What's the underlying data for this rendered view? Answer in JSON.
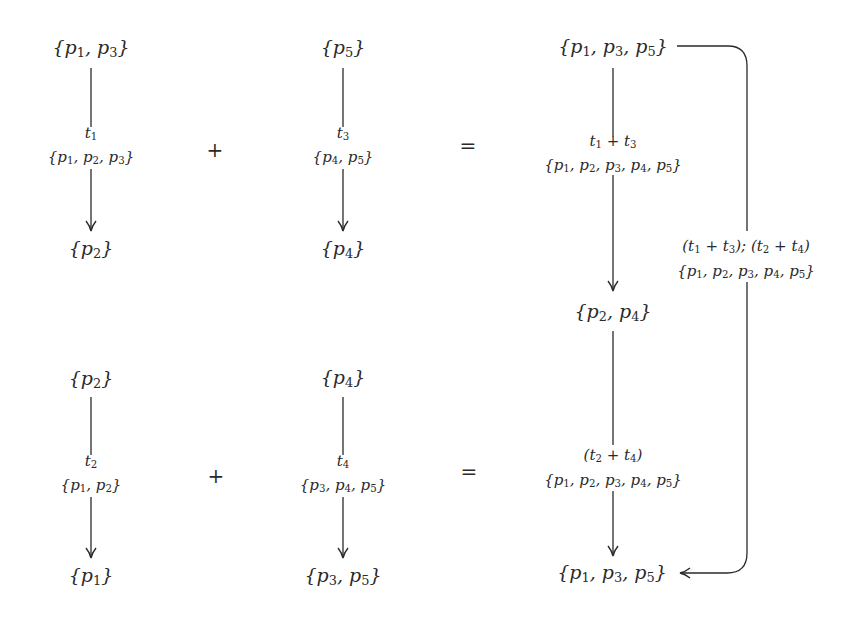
{
  "diagram": {
    "type": "petri-net transition composition",
    "rows": [
      {
        "left": {
          "pre": "{p1,p3}",
          "transition": "t1",
          "context": "{p1,p2,p3}",
          "post": "{p2}"
        },
        "operator_plus": "+",
        "right": {
          "pre": "{p5}",
          "transition": "t3",
          "context": "{p4,p5}",
          "post": "{p4}"
        },
        "operator_equals": "="
      },
      {
        "left": {
          "pre": "{p2}",
          "transition": "t2",
          "context": "{p1,p2}",
          "post": "{p1}"
        },
        "operator_plus": "+",
        "right": {
          "pre": "{p4}",
          "transition": "t4",
          "context": "{p3,p4,p5}",
          "post": "{p3,p5}"
        },
        "operator_equals": "="
      }
    ],
    "result": {
      "start": "{p1,p3,p5}",
      "step1_transition": "t1 + t3",
      "step1_context": "{p1,p2,p3,p4,p5}",
      "middle": "{p2,p4}",
      "step2_transition": "(t2 + t4)",
      "step2_context": "{p1,p2,p3,p4,p5}",
      "end": "{p1,p3,p5}",
      "composite_transition": "(t1 + t3); (t2 + t4)",
      "composite_context": "{p1,p2,p3,p4,p5}"
    }
  }
}
